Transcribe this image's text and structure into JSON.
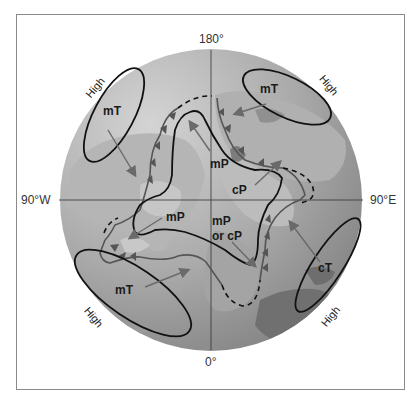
{
  "diagram": {
    "type": "polar-projection air mass source regions and polar front",
    "meridian_labels": {
      "top": "180°",
      "bottom": "0°",
      "left": "90°W",
      "right": "90°E"
    },
    "high_pressure_labels": [
      "High",
      "High",
      "High",
      "High"
    ],
    "air_masses": [
      {
        "id": "mt-upper-left",
        "label": "mT"
      },
      {
        "id": "mt-upper-right",
        "label": "mT"
      },
      {
        "id": "mt-lower-left",
        "label": "mT"
      },
      {
        "id": "ct-lower-right",
        "label": "cT"
      },
      {
        "id": "mp-center-top",
        "label": "mP"
      },
      {
        "id": "cp-center-right",
        "label": "cP"
      },
      {
        "id": "mp-center-left",
        "label": "mP"
      },
      {
        "id": "mp-or-cp-line1",
        "label": "mP"
      },
      {
        "id": "mp-or-cp-line2",
        "label": "or cP"
      }
    ],
    "colors": {
      "ocean_light": "#cfcfcf",
      "ocean_dark": "#8a8a8a",
      "land_light": "#b9b9b9",
      "land_dark": "#7a7a7a",
      "front": "#555555",
      "outline": "#111111",
      "arrow": "#6a6a6a"
    }
  }
}
